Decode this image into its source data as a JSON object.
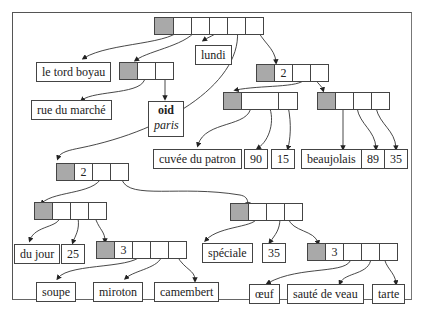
{
  "diagram": {
    "type": "tree",
    "colors": {
      "header_cell": "#a9a9a9",
      "cell_border": "#444444",
      "frame": "#555555",
      "background": "#ffffff"
    },
    "nodes": {
      "root": {
        "count": "",
        "cells": 5
      },
      "n_left": {
        "count": "",
        "cells": 2
      },
      "n_right": {
        "count": "2",
        "cells": 3
      },
      "n_right_a": {
        "count": "",
        "cells": 3
      },
      "n_right_b": {
        "count": "",
        "cells": 4
      },
      "n_mid": {
        "count": "2",
        "cells": 3
      },
      "n_mid_a": {
        "count": "",
        "cells": 3
      },
      "n_mid_a3": {
        "count": "3",
        "cells": 4
      },
      "n_mid_b": {
        "count": "",
        "cells": 3
      },
      "n_mid_b3": {
        "count": "3",
        "cells": 4
      }
    },
    "leaves": {
      "le_tord_boyau": "le tord boyau",
      "lundi": "lundi",
      "rue_du_marche": "rue du marché",
      "oid": "oid",
      "paris": "paris",
      "cuvee_du_patron": "cuvée du patron",
      "v90": "90",
      "v15": "15",
      "beaujolais": "beaujolais",
      "v89": "89",
      "v35a": "35",
      "du_jour": "du jour",
      "v25": "25",
      "soupe": "soupe",
      "miroton": "miroton",
      "camembert": "camembert",
      "speciale": "spéciale",
      "v35b": "35",
      "oeuf": "œuf",
      "saute_de_veau": "sauté de veau",
      "tarte": "tarte"
    },
    "caption": "R... (caption truncated at bottom edge)"
  }
}
